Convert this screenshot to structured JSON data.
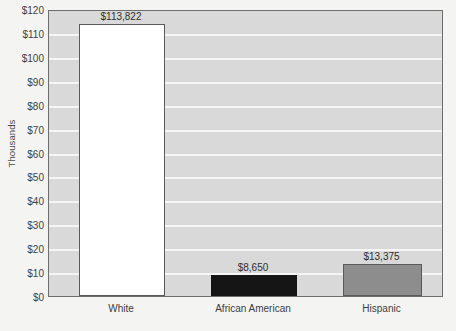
{
  "chart_data": {
    "type": "bar",
    "title": "",
    "xlabel": "",
    "ylabel": "Thousands",
    "categories": [
      "White",
      "African American",
      "Hispanic"
    ],
    "values": [
      113822,
      8650,
      13375
    ],
    "value_labels": [
      "$113,822",
      "$8,650",
      "$13,375"
    ],
    "bar_colors": [
      "#ffffff",
      "#151515",
      "#8d8d8d"
    ],
    "ylim": [
      0,
      120000
    ],
    "y_tick_values": [
      0,
      10000,
      20000,
      30000,
      40000,
      50000,
      60000,
      70000,
      80000,
      90000,
      100000,
      110000,
      120000
    ],
    "y_tick_labels": [
      "$0",
      "$10",
      "$20",
      "$30",
      "$40",
      "$50",
      "$60",
      "$70",
      "$80",
      "$90",
      "$100",
      "$110",
      "$120"
    ],
    "grid": true,
    "grid_orientation": "horizontal",
    "legend": false,
    "plot_background": "#d9d9d9",
    "gridline_color": "#f6f6f6",
    "axis_color": "#6e6e6e"
  },
  "caption_fragment": "  "
}
